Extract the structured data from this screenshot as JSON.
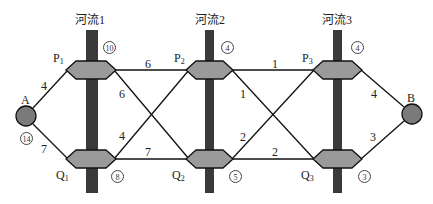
{
  "rivers": [
    {
      "label": "河流1",
      "bridge_capacity_top": "10",
      "bridge_capacity_bottom": "8"
    },
    {
      "label": "河流2",
      "bridge_capacity_top": "4",
      "bridge_capacity_bottom": "5"
    },
    {
      "label": "河流3",
      "bridge_capacity_top": "4",
      "bridge_capacity_bottom": "3"
    }
  ],
  "nodes": {
    "A": {
      "label": "A",
      "capacity": "14"
    },
    "B": {
      "label": "B"
    },
    "P1": {
      "label": "P",
      "sub": "1"
    },
    "P2": {
      "label": "P",
      "sub": "2"
    },
    "P3": {
      "label": "P",
      "sub": "3"
    },
    "Q1": {
      "label": "Q",
      "sub": "1"
    },
    "Q2": {
      "label": "Q",
      "sub": "2"
    },
    "Q3": {
      "label": "Q",
      "sub": "3"
    }
  },
  "edges": [
    {
      "from": "A",
      "to": "P1",
      "weight": "4"
    },
    {
      "from": "A",
      "to": "Q1",
      "weight": "7"
    },
    {
      "from": "P1",
      "to": "P2",
      "weight": "6"
    },
    {
      "from": "P1",
      "to": "Q2",
      "weight": "6"
    },
    {
      "from": "Q1",
      "to": "P2",
      "weight": "4"
    },
    {
      "from": "Q1",
      "to": "Q2",
      "weight": "7"
    },
    {
      "from": "P2",
      "to": "P3",
      "weight": "1"
    },
    {
      "from": "P2",
      "to": "Q3",
      "weight": "1"
    },
    {
      "from": "Q2",
      "to": "P3",
      "weight": "2"
    },
    {
      "from": "Q2",
      "to": "Q3",
      "weight": "2"
    },
    {
      "from": "P3",
      "to": "B",
      "weight": "4"
    },
    {
      "from": "Q3",
      "to": "B",
      "weight": "3"
    }
  ],
  "colors": {
    "river": "#3a3a3a",
    "bridge": "#9a9a9a",
    "node": "#7a7a7a",
    "line": "#111111"
  }
}
